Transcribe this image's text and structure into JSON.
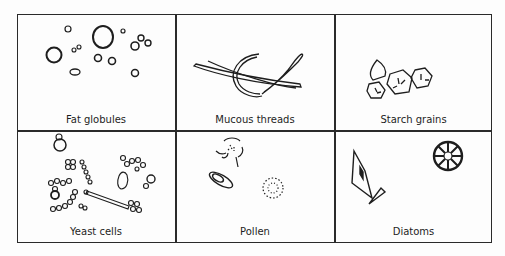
{
  "figure": {
    "panels": [
      {
        "label": "Fat globules",
        "icon": "fat-globules-drawing"
      },
      {
        "label": "Mucous threads",
        "icon": "mucous-threads-drawing"
      },
      {
        "label": "Starch grains",
        "icon": "starch-grains-drawing"
      },
      {
        "label": "Yeast cells",
        "icon": "yeast-cells-drawing"
      },
      {
        "label": "Pollen",
        "icon": "pollen-drawing"
      },
      {
        "label": "Diatoms",
        "icon": "diatoms-drawing"
      }
    ],
    "colors": {
      "ink": "#1e1e1e",
      "background": "#fdfdfd"
    }
  }
}
